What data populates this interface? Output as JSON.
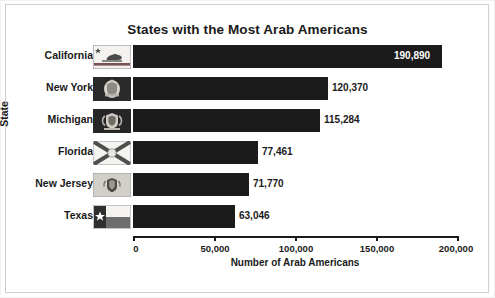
{
  "chart_data": {
    "type": "bar",
    "orientation": "horizontal",
    "title": "States with the Most Arab Americans",
    "xlabel": "Number of Arab Americans",
    "ylabel": "State",
    "categories": [
      "California",
      "New York",
      "Michigan",
      "Florida",
      "New Jersey",
      "Texas"
    ],
    "values": [
      190890,
      120370,
      115284,
      77461,
      71770,
      63046
    ],
    "value_labels": [
      "190,890",
      "120,370",
      "115,284",
      "77,461",
      "71,770",
      "63,046"
    ],
    "xlim": [
      0,
      200000
    ],
    "xticks": [
      0,
      50000,
      100000,
      150000,
      200000
    ],
    "xtick_labels": [
      "0",
      "50,000",
      "100,000",
      "150,000",
      "200,000"
    ],
    "grid": false,
    "legend": "none",
    "bar_color": "#1b1b1b",
    "background_color": "#ffffff",
    "text_color": "#1a1a1a",
    "category_icons": [
      "california-flag-icon",
      "new-york-flag-icon",
      "michigan-flag-icon",
      "florida-flag-icon",
      "new-jersey-flag-icon",
      "texas-flag-icon"
    ]
  },
  "rows": [
    {
      "label": "California",
      "value_label": "190,890",
      "icon": "california-flag-icon"
    },
    {
      "label": "New York",
      "value_label": "120,370",
      "icon": "new-york-flag-icon"
    },
    {
      "label": "Michigan",
      "value_label": "115,284",
      "icon": "michigan-flag-icon"
    },
    {
      "label": "Florida",
      "value_label": "77,461",
      "icon": "florida-flag-icon"
    },
    {
      "label": "New Jersey",
      "value_label": "71,770",
      "icon": "new-jersey-flag-icon"
    },
    {
      "label": "Texas",
      "value_label": "63,046",
      "icon": "texas-flag-icon"
    }
  ],
  "axes": {
    "x_tick_labels": [
      "0",
      "50,000",
      "100,000",
      "150,000",
      "200,000"
    ],
    "x_title": "Number of Arab Americans",
    "y_title": "State"
  }
}
